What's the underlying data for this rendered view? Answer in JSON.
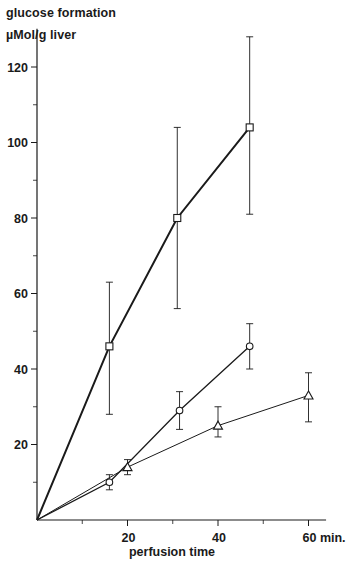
{
  "chart_data": {
    "type": "line",
    "title": "glucose formation",
    "ylabel": "µMol/g liver",
    "xlabel": "perfusion time",
    "x_unit": "min.",
    "xlim": [
      0,
      63
    ],
    "ylim": [
      0,
      128
    ],
    "x_ticks": [
      20,
      40,
      60
    ],
    "x_tick_labels": [
      "20",
      "40",
      "60 min."
    ],
    "x_minor_ticks": [
      10,
      30,
      50
    ],
    "y_ticks": [
      20,
      40,
      60,
      80,
      100,
      120
    ],
    "y_tick_labels": [
      "20",
      "40",
      "60",
      "80",
      "100",
      "120"
    ],
    "y_minor_ticks": [
      10,
      30,
      50,
      70,
      90,
      110
    ],
    "grid": false,
    "legend": null,
    "origin_included": true,
    "series": [
      {
        "name": "square",
        "marker": "square",
        "line_width": 2,
        "x": [
          0,
          16,
          31,
          47
        ],
        "values": [
          0,
          46,
          80,
          104
        ],
        "error_low": [
          null,
          28,
          56,
          81
        ],
        "error_high": [
          null,
          63,
          104,
          128
        ]
      },
      {
        "name": "circle",
        "marker": "circle",
        "line_width": 1.3,
        "x": [
          0,
          16,
          31.5,
          47
        ],
        "values": [
          0,
          10,
          29,
          46
        ],
        "error_low": [
          null,
          8,
          24,
          40
        ],
        "error_high": [
          null,
          12,
          34,
          52
        ]
      },
      {
        "name": "triangle",
        "marker": "triangle",
        "line_width": 1,
        "x": [
          0,
          20,
          40,
          60
        ],
        "values": [
          0,
          14,
          25,
          33
        ],
        "error_low": [
          null,
          12,
          22,
          26
        ],
        "error_high": [
          null,
          16,
          30,
          39
        ]
      }
    ]
  },
  "labels": {
    "title_line1": "glucose formation",
    "title_line2": "µMol/g liver",
    "x_axis_title": "perfusion time"
  },
  "colors": {
    "ink": "#1a1a1a",
    "background": "#ffffff"
  }
}
